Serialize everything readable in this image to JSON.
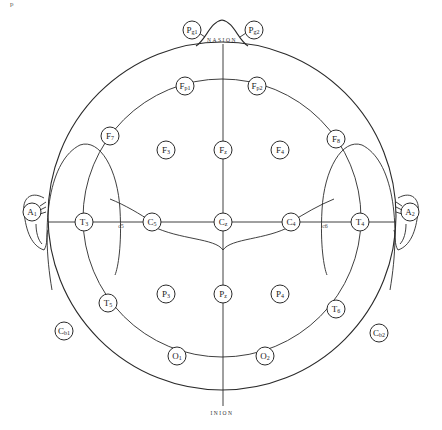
{
  "figure": {
    "corner_mark": "p",
    "landmarks": {
      "nasion": "NASION",
      "inion": "INION"
    },
    "electrodes": {
      "Pg1": {
        "label": "Pg1",
        "main": "P",
        "sub": "g1",
        "x": 192,
        "y": 30
      },
      "Pg2": {
        "label": "Pg2",
        "main": "P",
        "sub": "g2",
        "x": 254,
        "y": 30
      },
      "Fp1": {
        "label": "Fp1",
        "main": "F",
        "sub": "p1",
        "x": 185,
        "y": 86
      },
      "Fp2": {
        "label": "Fp2",
        "main": "F",
        "sub": "p2",
        "x": 257,
        "y": 86
      },
      "F7": {
        "label": "F7",
        "main": "F",
        "sub": "7",
        "x": 110,
        "y": 136
      },
      "F3": {
        "label": "F3",
        "main": "F",
        "sub": "3",
        "x": 166,
        "y": 150
      },
      "Fz": {
        "label": "Fz",
        "main": "F",
        "sub": "z",
        "x": 223,
        "y": 150
      },
      "F4": {
        "label": "F4",
        "main": "F",
        "sub": "4",
        "x": 280,
        "y": 150
      },
      "F8": {
        "label": "F8",
        "main": "F",
        "sub": "8",
        "x": 336,
        "y": 139
      },
      "A1": {
        "label": "A1",
        "main": "A",
        "sub": "1",
        "x": 32,
        "y": 212
      },
      "T3": {
        "label": "T3",
        "main": "T",
        "sub": "3",
        "x": 84,
        "y": 222
      },
      "C5": {
        "label": "C5",
        "main": "C",
        "sub": "5",
        "x": 152,
        "y": 222
      },
      "Cz": {
        "label": "Cz",
        "main": "C",
        "sub": "z",
        "x": 223,
        "y": 222
      },
      "C4": {
        "label": "C4",
        "main": "C",
        "sub": "4",
        "x": 291,
        "y": 222
      },
      "T4": {
        "label": "T4",
        "main": "T",
        "sub": "4",
        "x": 360,
        "y": 222
      },
      "A2": {
        "label": "A2",
        "main": "A",
        "sub": "2",
        "x": 410,
        "y": 212
      },
      "T5": {
        "label": "T5",
        "main": "T",
        "sub": "5",
        "x": 108,
        "y": 303
      },
      "P3": {
        "label": "P3",
        "main": "P",
        "sub": "3",
        "x": 166,
        "y": 294
      },
      "Pz": {
        "label": "Pz",
        "main": "P",
        "sub": "z",
        "x": 223,
        "y": 294
      },
      "P4": {
        "label": "P4",
        "main": "P",
        "sub": "4",
        "x": 280,
        "y": 294
      },
      "T6": {
        "label": "T6",
        "main": "T",
        "sub": "6",
        "x": 336,
        "y": 309
      },
      "Cb1": {
        "label": "Cb1",
        "main": "C",
        "sub": "b1",
        "x": 64,
        "y": 331
      },
      "Cb2": {
        "label": "Cb2",
        "main": "C",
        "sub": "b2",
        "x": 379,
        "y": 333
      },
      "O1": {
        "label": "O1",
        "main": "O",
        "sub": "1",
        "x": 177,
        "y": 356
      },
      "O2": {
        "label": "O2",
        "main": "O",
        "sub": "2",
        "x": 265,
        "y": 356
      }
    },
    "minor_labels": {
      "c5": "c5",
      "c6": "c6"
    }
  }
}
